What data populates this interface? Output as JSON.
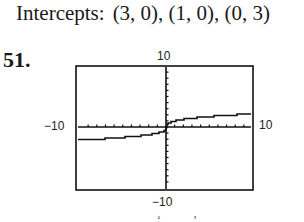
{
  "header": {
    "label": "Intercepts:",
    "points": "(3, 0), (1, 0), (0, 3)"
  },
  "problem": {
    "number": "51."
  },
  "graph": {
    "window_labels": {
      "ymax": "10",
      "ymin": "−10",
      "xmin": "−10",
      "xmax": "10"
    }
  },
  "chart_data": {
    "type": "line",
    "title": "",
    "xlabel": "",
    "ylabel": "",
    "xlim": [
      -10,
      10
    ],
    "ylim": [
      -10,
      10
    ],
    "grid": false,
    "tick_marks": "every 1 unit on both axes",
    "series": [
      {
        "name": "y = cube root of x (calculator step plot)",
        "x": [
          -10,
          -8,
          -6,
          -4,
          -2,
          -1,
          0,
          1,
          2,
          4,
          6,
          8,
          10
        ],
        "y": [
          -2.15,
          -2.0,
          -1.82,
          -1.59,
          -1.26,
          -1.0,
          0,
          1.0,
          1.26,
          1.59,
          1.82,
          2.0,
          2.15
        ]
      }
    ]
  }
}
